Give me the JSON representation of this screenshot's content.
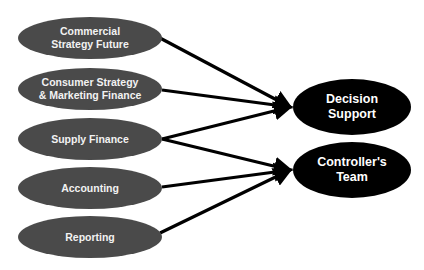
{
  "diagram": {
    "colors": {
      "source_fill": "#4a4a4a",
      "target_fill": "#000000",
      "edge": "#000000",
      "background": "#ffffff"
    },
    "sources": [
      {
        "id": "commercial",
        "label": "Commercial Strategy Future",
        "line1": "Commercial",
        "line2": "Strategy Future",
        "cx": 90,
        "cy": 38
      },
      {
        "id": "consumer",
        "label": "Consumer Strategy & Marketing Finance",
        "line1": "Consumer Strategy",
        "line2": "& Marketing Finance",
        "cx": 90,
        "cy": 89
      },
      {
        "id": "supply",
        "label": "Supply Finance",
        "line1": "Supply Finance",
        "line2": "",
        "cx": 90,
        "cy": 139
      },
      {
        "id": "accounting",
        "label": "Accounting",
        "line1": "Accounting",
        "line2": "",
        "cx": 90,
        "cy": 188
      },
      {
        "id": "reporting",
        "label": "Reporting",
        "line1": "Reporting",
        "line2": "",
        "cx": 90,
        "cy": 237
      }
    ],
    "targets": [
      {
        "id": "decision-support",
        "label": "Decision Support",
        "line1": "Decision",
        "line2": "Support",
        "cx": 352,
        "cy": 107
      },
      {
        "id": "controllers-team",
        "label": "Controller's Team",
        "line1": "Controller's",
        "line2": "Team",
        "cx": 352,
        "cy": 170
      }
    ],
    "edges": [
      {
        "from": "commercial",
        "to": "decision-support"
      },
      {
        "from": "consumer",
        "to": "decision-support"
      },
      {
        "from": "supply",
        "to": "decision-support"
      },
      {
        "from": "supply",
        "to": "controllers-team"
      },
      {
        "from": "accounting",
        "to": "controllers-team"
      },
      {
        "from": "reporting",
        "to": "controllers-team"
      }
    ]
  }
}
